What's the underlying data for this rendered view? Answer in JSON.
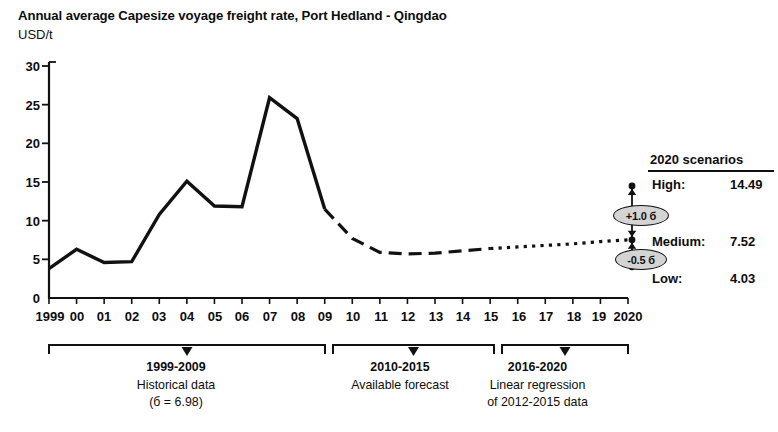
{
  "header": {
    "title": "Annual average Capesize voyage freight rate, Port Hedland - Qingdao",
    "unit_label": "USD/t"
  },
  "chart_data": {
    "type": "line",
    "title": "Annual average Capesize voyage freight rate, Port Hedland - Qingdao",
    "subtitle": "USD/t",
    "xlabel": "",
    "ylabel": "USD/t",
    "ylim": [
      0,
      30
    ],
    "xlim": [
      1999,
      2020
    ],
    "yticks": [
      0,
      5,
      10,
      15,
      20,
      25,
      30
    ],
    "ytick_labels": [
      "0",
      "5",
      "10",
      "15",
      "20",
      "25",
      "30"
    ],
    "xticks": [
      1999,
      2000,
      2001,
      2002,
      2003,
      2004,
      2005,
      2006,
      2007,
      2008,
      2009,
      2010,
      2011,
      2012,
      2013,
      2014,
      2015,
      2016,
      2017,
      2018,
      2019,
      2020
    ],
    "xtick_labels": [
      "1999",
      "00",
      "01",
      "02",
      "03",
      "04",
      "05",
      "06",
      "07",
      "08",
      "09",
      "10",
      "11",
      "12",
      "13",
      "14",
      "15",
      "16",
      "17",
      "18",
      "19",
      "2020"
    ],
    "grid": false,
    "legend": "none",
    "series": [
      {
        "name": "Historical data",
        "style": "solid",
        "x": [
          1999,
          2000,
          2001,
          2002,
          2003,
          2004,
          2005,
          2006,
          2007,
          2008,
          2009
        ],
        "values": [
          3.8,
          6.3,
          4.6,
          4.7,
          10.8,
          15.1,
          11.9,
          11.8,
          25.9,
          23.2,
          11.5
        ]
      },
      {
        "name": "Available forecast",
        "style": "dashed",
        "x": [
          2009,
          2010,
          2011,
          2012,
          2013,
          2014,
          2015
        ],
        "values": [
          11.5,
          7.7,
          5.9,
          5.7,
          5.8,
          6.1,
          6.4
        ]
      },
      {
        "name": "Linear regression of 2012-2015 data",
        "style": "dotted",
        "x": [
          2015,
          2016,
          2017,
          2018,
          2019,
          2020
        ],
        "values": [
          6.4,
          6.6,
          6.8,
          7.0,
          7.3,
          7.52
        ]
      }
    ],
    "annotations": [
      {
        "name": "high-marker",
        "label": "High",
        "x": 2020,
        "value": 14.49
      },
      {
        "name": "medium-marker",
        "label": "Medium",
        "x": 2020,
        "value": 7.52
      },
      {
        "name": "low-marker",
        "label": "Low",
        "x": 2020,
        "value": 4.03
      },
      {
        "name": "upper-sigma-pill",
        "label": "+1.0 б"
      },
      {
        "name": "lower-sigma-pill",
        "label": "-0.5 б"
      }
    ]
  },
  "scenarios": {
    "heading": "2020 scenarios",
    "rows": [
      {
        "label": "High:",
        "value": "14.49"
      },
      {
        "label": "Medium:",
        "value": "7.52"
      },
      {
        "label": "Low:",
        "value": "4.03"
      }
    ],
    "upper_sigma": "+1.0 б",
    "lower_sigma": "-0.5 б"
  },
  "period_brackets": [
    {
      "range": "1999-2009",
      "line1": "Historical data",
      "line2": "(б = 6.98)"
    },
    {
      "range": "2010-2015",
      "line1": "Available forecast",
      "line2": ""
    },
    {
      "range": "2016-2020",
      "line1": "Linear regression",
      "line2": "of 2012-2015 data"
    }
  ],
  "axis": {
    "y_tick_0": "0",
    "y_tick_5": "5",
    "y_tick_10": "10",
    "y_tick_15": "15",
    "y_tick_20": "20",
    "y_tick_25": "25",
    "y_tick_30": "30",
    "x_1999": "1999",
    "x_2000": "00",
    "x_2001": "01",
    "x_2002": "02",
    "x_2003": "03",
    "x_2004": "04",
    "x_2005": "05",
    "x_2006": "06",
    "x_2007": "07",
    "x_2008": "08",
    "x_2009": "09",
    "x_2010": "10",
    "x_2011": "11",
    "x_2012": "12",
    "x_2013": "13",
    "x_2014": "14",
    "x_2015": "15",
    "x_2016": "16",
    "x_2017": "17",
    "x_2018": "18",
    "x_2019": "19",
    "x_2020": "2020"
  },
  "colors": {
    "ink": "#0d0d0d",
    "line": "#111111",
    "pill_fill": "#d4d4d4"
  }
}
